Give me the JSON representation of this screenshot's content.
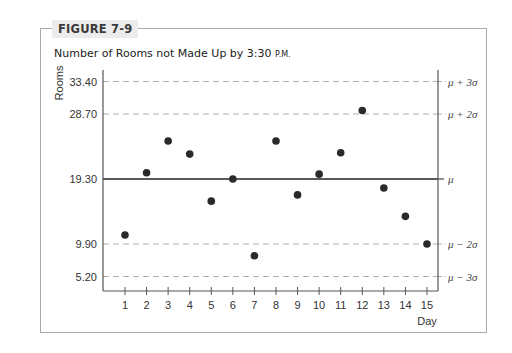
{
  "figure": {
    "label": "FIGURE 7-9",
    "subtitle_main": "Number of Rooms not Made Up by 3:30 ",
    "subtitle_suffix": "P.M."
  },
  "chart_data": {
    "type": "scatter",
    "title": "Number of Rooms not Made Up by 3:30 P.M.",
    "xlabel": "Day",
    "ylabel": "Rooms",
    "x": [
      1,
      2,
      3,
      4,
      5,
      6,
      7,
      8,
      9,
      10,
      11,
      12,
      13,
      14,
      15
    ],
    "series": [
      {
        "name": "Rooms not made up",
        "values": [
          11.2,
          20.2,
          24.8,
          22.9,
          16.1,
          19.3,
          8.2,
          24.8,
          17.0,
          20.0,
          23.1,
          29.2,
          18.0,
          13.9,
          9.9
        ]
      }
    ],
    "x_tick_labels": [
      "1",
      "2",
      "3",
      "4",
      "5",
      "6",
      "7",
      "8",
      "9",
      "10",
      "11",
      "12",
      "13",
      "14",
      "15"
    ],
    "y_tick_labels": [
      "33.40",
      "28.70",
      "19.30",
      "9.90",
      "5.20"
    ],
    "ylim": [
      2.0,
      35.0
    ],
    "xlim": [
      0,
      15.6
    ],
    "control_lines": [
      {
        "value": 33.4,
        "label": "μ + 3σ",
        "style": "dashed"
      },
      {
        "value": 28.7,
        "label": "μ + 2σ",
        "style": "dashed"
      },
      {
        "value": 19.3,
        "label": "μ",
        "style": "solid"
      },
      {
        "value": 9.9,
        "label": "μ − 2σ",
        "style": "dashed"
      },
      {
        "value": 5.2,
        "label": "μ − 3σ",
        "style": "dashed"
      }
    ],
    "grid": false,
    "legend": "none"
  },
  "colors": {
    "frame": "#a9a9a9",
    "axis": "#555555",
    "dashed": "#b0b0b0",
    "mean_line": "#222222",
    "point": "#2a2a2a"
  }
}
